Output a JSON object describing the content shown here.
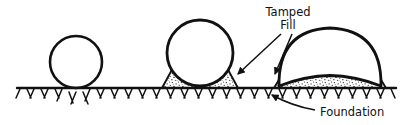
{
  "figure": {
    "background_color": "#ffffff",
    "ink_color": "#111111",
    "width": 413,
    "height": 125
  },
  "labels": {
    "tamped": "Tamped",
    "fill": "Fill",
    "foundation": "Foundation"
  },
  "ground": {
    "line_label": "ground-line",
    "hatch_label": "ground-hatching",
    "x_start": 17,
    "x_end": 396,
    "y": 88
  },
  "stages": [
    {
      "id": "stage-1",
      "name": "circular-form-on-grade",
      "shape": "circle",
      "center_x": 76,
      "center_y": 62,
      "radius": 26,
      "has_fill_berm": false
    },
    {
      "id": "stage-2",
      "name": "circular-form-on-tamped-fill",
      "shape": "circle",
      "center_x": 200,
      "center_y": 53,
      "radius": 33,
      "has_fill_berm": true
    },
    {
      "id": "stage-3",
      "name": "flattened-dome-on-tamped-fill",
      "shape": "dome",
      "center_x": 330,
      "center_y": 60,
      "radius": 55,
      "has_fill_berm": true
    }
  ],
  "annotations": [
    {
      "id": "tamped-fill-callout",
      "text_lines": [
        "Tamped",
        "Fill"
      ],
      "text_x": 288,
      "text_y": 16,
      "arrows": 2,
      "targets": [
        "stage-2-berm-right",
        "stage-3-berm-left"
      ]
    },
    {
      "id": "foundation-callout",
      "text_lines": [
        "Foundation"
      ],
      "text_x": 320,
      "text_y": 116,
      "arrows": 1,
      "targets": [
        "ground-hatching"
      ]
    }
  ]
}
